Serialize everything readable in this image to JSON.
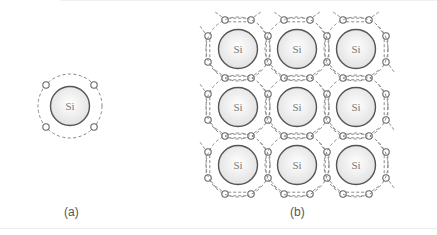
{
  "figure": {
    "panel_a": {
      "caption": "(a)",
      "atom_label": "Si",
      "description": "Single silicon atom with four valence electrons",
      "valence_electrons": 4
    },
    "panel_b": {
      "caption": "(b)",
      "atom_label": "Si",
      "description": "Silicon crystal lattice with covalent bonds (shared electron pairs)",
      "rows": 3,
      "cols": 3,
      "atoms": [
        [
          "Si",
          "Si",
          "Si"
        ],
        [
          "Si",
          "Si",
          "Si"
        ],
        [
          "Si",
          "Si",
          "Si"
        ]
      ]
    }
  },
  "colors": {
    "atom_stroke": "#555555",
    "atom_fill_center": "#ffffff",
    "atom_fill_edge": "#e2e2e2",
    "electron_stroke": "#666666",
    "dashed_stroke": "#888888",
    "label_color": "#777777"
  }
}
